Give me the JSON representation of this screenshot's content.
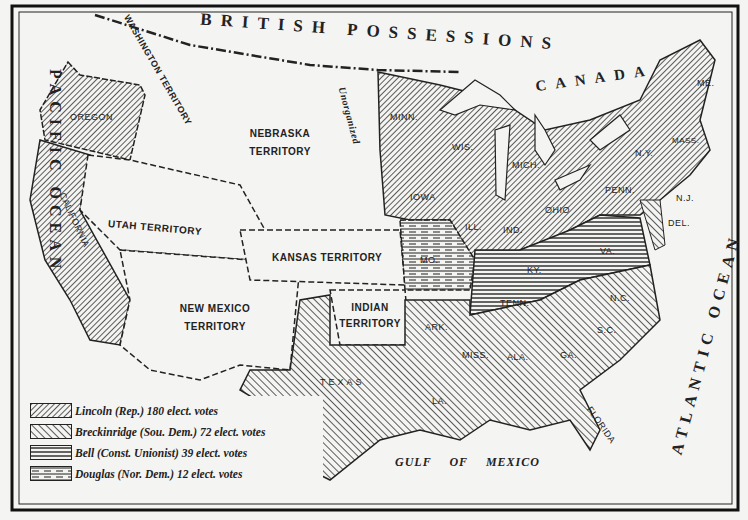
{
  "map": {
    "title_regions": {
      "north": "BRITISH POSSESSIONS",
      "canada": "CANADA",
      "pacific": "PACIFIC OCEAN",
      "atlantic": "ATLANTIC OCEAN",
      "gulf": "GULF OF MEXICO"
    },
    "territories": [
      {
        "name": "WASHINGTON TERRITORY"
      },
      {
        "name": "NEBRASKA TERRITORY"
      },
      {
        "name": "Unorganized"
      },
      {
        "name": "UTAH TERRITORY"
      },
      {
        "name": "KANSAS TERRITORY"
      },
      {
        "name": "NEW MEXICO TERRITORY"
      },
      {
        "name": "INDIAN TERRITORY"
      }
    ],
    "lakes": [
      "L. Superior",
      "L. Michigan",
      "L. Huron",
      "L. Erie",
      "L. Ontario"
    ],
    "states": {
      "lincoln": [
        "OREGON",
        "CALIFORNIA",
        "MINN.",
        "WIS.",
        "IOWA",
        "MICH.",
        "ILL.",
        "IND.",
        "OHIO",
        "PENN.",
        "N.Y.",
        "N.J.",
        "VT.",
        "N.H.",
        "ME.",
        "MASS.",
        "CONN.",
        "R.I."
      ],
      "breckinridge": [
        "TEXAS",
        "ARK.",
        "LA.",
        "MISS.",
        "ALA.",
        "GA.",
        "FLORIDA",
        "S.C.",
        "N.C.",
        "MD.",
        "DEL."
      ],
      "bell": [
        "VA.",
        "KY.",
        "TENN."
      ],
      "douglas": [
        "MO."
      ]
    }
  },
  "legend": {
    "items": [
      {
        "candidate": "Lincoln",
        "party": "(Rep.)",
        "votes": "180 elect. votes",
        "label": "Lincoln (Rep.) 180 elect. votes",
        "pattern": "hatch-right"
      },
      {
        "candidate": "Breckinridge",
        "party": "(Sou. Dem.)",
        "votes": "72 elect. votes",
        "label": "Breckinridge (Sou. Dem.) 72 elect. votes",
        "pattern": "hatch-left"
      },
      {
        "candidate": "Bell",
        "party": "(Const. Unionist)",
        "votes": "39 elect. votes",
        "label": "Bell (Const. Unionist) 39 elect. votes",
        "pattern": "horizontal"
      },
      {
        "candidate": "Douglas",
        "party": "(Nor. Dem.)",
        "votes": "12 elect. votes",
        "label": "Douglas (Nor. Dem.) 12 elect. votes",
        "pattern": "dashed-horizontal"
      }
    ]
  },
  "colors": {
    "ink": "#222222",
    "paper": "#f4f4f2"
  }
}
